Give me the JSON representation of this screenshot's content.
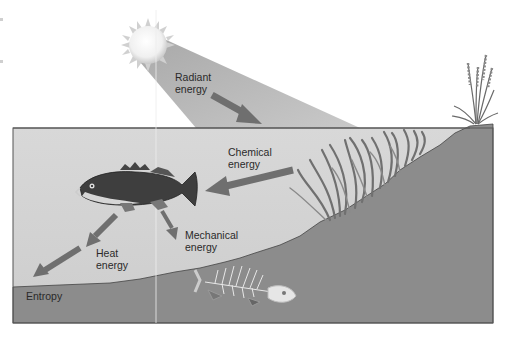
{
  "diagram": {
    "type": "energy-flow-illustration",
    "colors": {
      "background": "#ffffff",
      "water": "#d2d2d2",
      "ground": "#8c8c8c",
      "light_beam": "#bdbdbd",
      "arrow": "#6f6f6f",
      "outline": "#555555",
      "text": "#2a2a2a"
    },
    "labels": {
      "radiant": "Radiant\nenergy",
      "chemical": "Chemical\nenergy",
      "mechanical": "Mechanical\nenergy",
      "heat": "Heat\nenergy",
      "entropy": "Entropy"
    },
    "elements": [
      "sun",
      "light-beam",
      "water",
      "sloping-ground",
      "shore-grass",
      "seaweed",
      "live-fish",
      "fish-skeleton"
    ],
    "flow": [
      {
        "from": "sun",
        "to": "seaweed",
        "label": "Radiant energy"
      },
      {
        "from": "seaweed",
        "to": "live-fish",
        "label": "Chemical energy"
      },
      {
        "from": "live-fish",
        "to": "motion",
        "label": "Mechanical energy"
      },
      {
        "from": "live-fish",
        "to": "environment",
        "label": "Heat energy"
      },
      {
        "from": "environment",
        "to": "entropy",
        "label": "Entropy"
      }
    ]
  }
}
